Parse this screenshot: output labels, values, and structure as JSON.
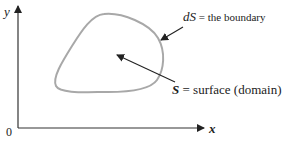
{
  "diagram": {
    "axes": {
      "x_label": "x",
      "y_label": "y",
      "origin_label": "0"
    },
    "boundary_annotation": {
      "symbol": "dS",
      "text": " = the boundary"
    },
    "surface_annotation": {
      "symbol": "S",
      "text": " = surface (domain)"
    },
    "colors": {
      "boundary_curve": "#a8a8a8",
      "axes": "#333333",
      "arrows": "#222222"
    }
  }
}
